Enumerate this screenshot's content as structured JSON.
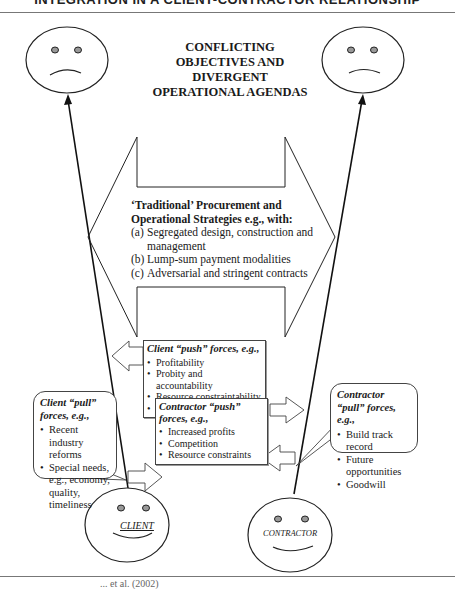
{
  "header": {
    "title": "INTEGRATION IN A CLIENT-CONTRACTOR RELATIONSHIP"
  },
  "center_title": "CONFLICTING OBJECTIVES AND DIVERGENT OPERATIONAL AGENDAS",
  "strategies": {
    "heading": "‘Traditional’ Procurement and Operational Strategies e.g., with:",
    "items": [
      {
        "label": "(a)",
        "text": "Segregated design, construction and management"
      },
      {
        "label": "(b)",
        "text": "Lump-sum payment modalities"
      },
      {
        "label": "(c)",
        "text": "Adversarial and stringent contracts"
      }
    ]
  },
  "client_push": {
    "heading": "Client “push” forces, e.g.,",
    "items": [
      "Profitability",
      "Probity and accountability",
      "Resource constraintability",
      "Cultural inertia"
    ]
  },
  "contractor_push": {
    "heading": "Contractor “push” forces, e.g.,",
    "items": [
      "Increased profits",
      "Competition",
      "Resource constraints"
    ]
  },
  "client_pull": {
    "heading": "Client “pull” forces, e.g.,",
    "items": [
      "Recent industry reforms",
      "Special needs, e.g., economy, quality, timeliness"
    ]
  },
  "contractor_pull": {
    "heading": "Contractor “pull” forces, e.g.,",
    "items": [
      "Build track record",
      "Future opportunities",
      "Goodwill"
    ]
  },
  "faces": {
    "top_left": "sad-face",
    "top_right": "sad-face",
    "client": {
      "label": "CLIENT",
      "expression": "happy-face"
    },
    "contractor": {
      "label": "CONTRACTOR",
      "expression": "happy-face"
    }
  },
  "footer": {
    "citation_fragment": "... et al. (2002)"
  }
}
